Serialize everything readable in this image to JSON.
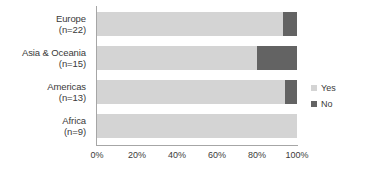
{
  "chart_data": {
    "type": "bar",
    "orientation": "horizontal",
    "stacked": true,
    "percent_stacked": true,
    "title": "",
    "xlabel": "",
    "ylabel": "",
    "xlim": [
      0,
      100
    ],
    "grid": false,
    "legend_position": "right",
    "categories": [
      "Europe",
      "Asia & Oceania",
      "Americas",
      "Africa"
    ],
    "category_labels": [
      {
        "name": "Europe",
        "n_label": "(n=22)",
        "n": 22
      },
      {
        "name": "Asia & Oceania",
        "n_label": "(n=15)",
        "n": 15
      },
      {
        "name": "Americas",
        "n_label": "(n=13)",
        "n": 13
      },
      {
        "name": "Africa",
        "n_label": "(n=9)",
        "n": 9
      }
    ],
    "series": [
      {
        "name": "Yes",
        "color": "#d4d4d4",
        "values": [
          93,
          80,
          94,
          100
        ]
      },
      {
        "name": "No",
        "color": "#636363",
        "values": [
          7,
          20,
          6,
          0
        ]
      }
    ],
    "tick_labels": [
      "0%",
      "20%",
      "40%",
      "60%",
      "80%",
      "100%"
    ],
    "tick_values": [
      0,
      20,
      40,
      60,
      80,
      100
    ]
  },
  "legend": {
    "items": [
      {
        "label": "Yes",
        "color": "#d4d4d4"
      },
      {
        "label": "No",
        "color": "#636363"
      }
    ]
  },
  "colors": {
    "yes": "#d4d4d4",
    "no": "#636363",
    "axis": "#a6a6a6",
    "text": "#3a3a3a",
    "background": "#ffffff"
  }
}
